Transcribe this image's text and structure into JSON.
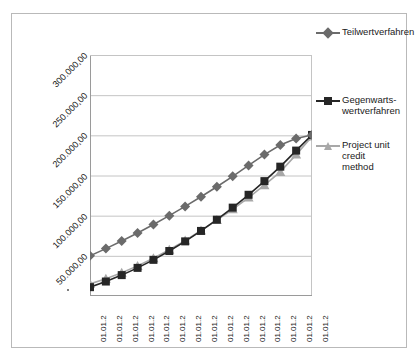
{
  "chart_data": {
    "type": "line",
    "title": "",
    "xlabel": "",
    "ylabel": "",
    "ylim": [
      0,
      300000
    ],
    "grid": true,
    "legend_position": "right",
    "y_ticks": [
      "50.000,00",
      "100.000,00",
      "150.000,00",
      "200.000,00",
      "250.000,00",
      "300.000,00"
    ],
    "y_tick_values": [
      50000,
      100000,
      150000,
      200000,
      250000,
      300000
    ],
    "categories": [
      "01.01.2",
      "01.01.2",
      "01.01.2",
      "01.01.2",
      "01.01.2",
      "01.01.2",
      "01.01.2",
      "01.01.2",
      "01.01.2",
      "01.01.2",
      "01.01.2",
      "01.01.2",
      "01.01.2",
      "01.01.2",
      "01.01.2"
    ],
    "series": [
      {
        "name": "Teilwertverfahren",
        "marker": "diamond",
        "color": "#6b6b6b",
        "values": [
          50000,
          59000,
          68500,
          78500,
          89000,
          100000,
          111500,
          123500,
          136000,
          149000,
          162500,
          176000,
          188000,
          196000,
          200500
        ]
      },
      {
        "name": "Gegenwarts-wertverfahren",
        "marker": "square",
        "color": "#262626",
        "values": [
          11000,
          18000,
          26000,
          35000,
          45000,
          56000,
          68000,
          81000,
          95000,
          110000,
          126000,
          143000,
          161000,
          181000,
          200500
        ]
      },
      {
        "name": "Project unit credit method",
        "marker": "triangle",
        "color": "#a8a8a8",
        "values": [
          15000,
          21500,
          29000,
          37500,
          47000,
          57500,
          69000,
          81500,
          94500,
          108000,
          122500,
          138000,
          154500,
          176000,
          198500
        ]
      }
    ]
  },
  "legend": {
    "entries": [
      {
        "label": "Teilwertverfahren"
      },
      {
        "label": "Gegenwarts-\nwertverfahren"
      },
      {
        "label": "Project unit credit\nmethod"
      }
    ]
  },
  "colors": {
    "series_1": "#6b6b6b",
    "series_2": "#262626",
    "series_3": "#a8a8a8",
    "gridline": "#c4c4c4",
    "axis": "#9a9a9a",
    "frame": "#b9b9b9",
    "text": "#1a1a1a",
    "background": "#ffffff"
  }
}
